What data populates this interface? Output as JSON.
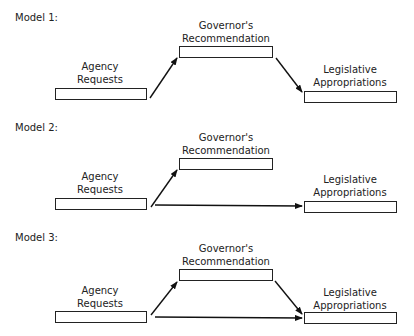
{
  "models": [
    {
      "title": "Model 1:",
      "agency": {
        "line1": "Agency",
        "line2": "Requests"
      },
      "governor": {
        "line1": "Governor's",
        "line2": "Recommendation"
      },
      "legislative": {
        "line1": "Legislative",
        "line2": "Appropriations"
      },
      "arrows": [
        "agency->governor",
        "governor->legislative"
      ]
    },
    {
      "title": "Model 2:",
      "agency": {
        "line1": "Agency",
        "line2": "Requests"
      },
      "governor": {
        "line1": "Governor's",
        "line2": "Recommendation"
      },
      "legislative": {
        "line1": "Legislative",
        "line2": "Appropriations"
      },
      "arrows": [
        "agency->governor",
        "agency->legislative"
      ]
    },
    {
      "title": "Model 3:",
      "agency": {
        "line1": "Agency",
        "line2": "Requests"
      },
      "governor": {
        "line1": "Governor's",
        "line2": "Recommendation"
      },
      "legislative": {
        "line1": "Legislative",
        "line2": "Appropriations"
      },
      "arrows": [
        "agency->governor",
        "governor->legislative",
        "agency->legislative"
      ]
    }
  ]
}
